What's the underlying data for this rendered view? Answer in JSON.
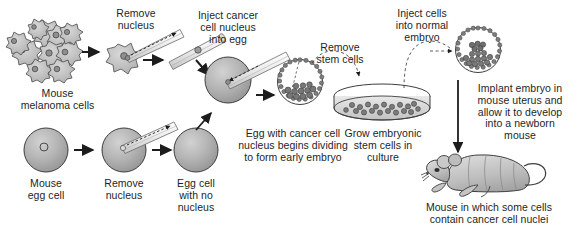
{
  "diagram": {
    "background": "#ffffff",
    "ink": "#221f1f",
    "cell_fill": "#b3b3b3",
    "cell_stroke": "#3a3a3a"
  },
  "labels": {
    "mouse_melanoma_cells": "Mouse\nmelanoma cells",
    "remove_nucleus_top": "Remove\nnucleus",
    "inject_cancer_cell_nucleus": "Inject cancer\ncell nucleus\ninto egg",
    "remove_stem_cells": "Remove\nstem cells",
    "inject_cells_into_normal_embryo": "Inject cells\ninto normal\nembryo",
    "implant_embryo": "Implant embryo in\nmouse uterus and\nallow it to develop\ninto a newborn\nmouse",
    "mouse_egg_cell": "Mouse\negg cell",
    "remove_nucleus_bottom": "Remove\nnucleus",
    "egg_cell_with_no_nucleus": "Egg cell\nwith no\nnucleus",
    "egg_with_cancer_cell_nucleus": "Egg with cancer cell\nnucleus begins dividing\nto form early embryo",
    "grow_embryonic_stem_cells": "Grow embryonic\nstem cells in\nculture",
    "mouse_with_cancer_nuclei": "Mouse in which some cells\ncontain cancer cell nuclei"
  },
  "icons": {
    "melanoma_cluster": "melanoma-cell-cluster-icon",
    "single_melanoma_cell": "single-melanoma-cell-icon",
    "micropipette_extract": "micropipette-extracting-nucleus-icon",
    "micropipette_carrying": "micropipette-carrying-nucleus-icon",
    "micropipette_inject": "micropipette-injecting-nucleus-icon",
    "egg_cell": "egg-cell-icon",
    "enucleated_egg": "enucleated-egg-cell-icon",
    "blastocyst": "blastocyst-embryo-icon",
    "petri_dish": "petri-dish-icon",
    "normal_embryo": "normal-embryo-icon",
    "newborn_mouse": "newborn-mouse-icon",
    "arrow": "arrow-icon",
    "dashed_arrow": "dashed-arrow-icon"
  }
}
